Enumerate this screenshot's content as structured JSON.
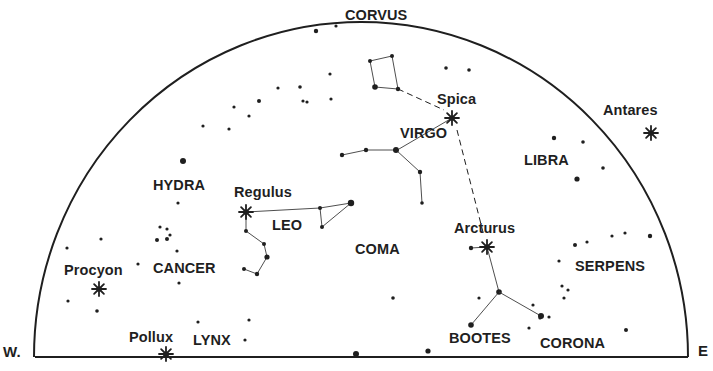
{
  "chart_data": {
    "type": "sky-chart",
    "title": "",
    "directions": {
      "west": "W.",
      "east": "E"
    },
    "ink_color": "#1f1f1f",
    "horizon": {
      "x1": 35,
      "x2": 688,
      "y": 357
    },
    "dome": {
      "cx": 361,
      "cy": 357,
      "rx": 327,
      "ry": 335
    },
    "constellations": [
      {
        "name": "CORVUS",
        "x": 345,
        "y": 8
      },
      {
        "name": "VIRGO",
        "x": 400,
        "y": 126
      },
      {
        "name": "LIBRA",
        "x": 524,
        "y": 153
      },
      {
        "name": "HYDRA",
        "x": 153,
        "y": 178
      },
      {
        "name": "LEO",
        "x": 272,
        "y": 218
      },
      {
        "name": "COMA",
        "x": 355,
        "y": 242
      },
      {
        "name": "CANCER",
        "x": 153,
        "y": 261
      },
      {
        "name": "SERPENS",
        "x": 575,
        "y": 259
      },
      {
        "name": "LYNX",
        "x": 193,
        "y": 333
      },
      {
        "name": "BOOTES",
        "x": 449,
        "y": 331
      },
      {
        "name": "CORONA",
        "x": 540,
        "y": 336
      }
    ],
    "named_stars": [
      {
        "name": "Spica",
        "label_x": 437,
        "label_y": 92,
        "x": 452,
        "y": 118
      },
      {
        "name": "Antares",
        "label_x": 603,
        "label_y": 103,
        "x": 651,
        "y": 133
      },
      {
        "name": "Regulus",
        "label_x": 234,
        "label_y": 185,
        "x": 246,
        "y": 212
      },
      {
        "name": "Arcturus",
        "label_x": 454,
        "label_y": 221,
        "x": 487,
        "y": 247
      },
      {
        "name": "Procyon",
        "label_x": 64,
        "label_y": 263,
        "x": 99,
        "y": 289
      },
      {
        "name": "Pollux",
        "label_x": 129,
        "label_y": 330,
        "x": 166,
        "y": 354
      }
    ],
    "stars": [
      [
        316,
        31,
        2.2
      ],
      [
        336,
        26,
        1.6
      ],
      [
        330,
        74,
        1.6
      ],
      [
        300,
        87,
        1.8
      ],
      [
        303,
        101,
        1.6
      ],
      [
        307,
        102,
        1.6
      ],
      [
        331,
        99,
        1.6
      ],
      [
        278,
        88,
        1.6
      ],
      [
        259,
        101,
        2.0
      ],
      [
        234,
        107,
        1.6
      ],
      [
        249,
        116,
        1.6
      ],
      [
        203,
        126,
        1.6
      ],
      [
        229,
        129,
        1.6
      ],
      [
        183,
        161,
        3.0
      ],
      [
        446,
        68,
        1.8
      ],
      [
        469,
        70,
        1.8
      ],
      [
        554,
        138,
        2.2
      ],
      [
        583,
        142,
        1.8
      ],
      [
        603,
        168,
        1.8
      ],
      [
        577,
        179,
        2.6
      ],
      [
        178,
        203,
        1.6
      ],
      [
        160,
        227,
        1.6
      ],
      [
        167,
        229,
        1.6
      ],
      [
        170,
        235,
        1.6
      ],
      [
        157,
        240,
        2.0
      ],
      [
        167,
        239,
        2.0
      ],
      [
        177,
        251,
        1.6
      ],
      [
        138,
        264,
        1.6
      ],
      [
        179,
        283,
        1.6
      ],
      [
        101,
        239,
        1.6
      ],
      [
        67,
        248,
        1.6
      ],
      [
        68,
        301,
        1.6
      ],
      [
        97,
        311,
        1.8
      ],
      [
        198,
        322,
        1.6
      ],
      [
        249,
        320,
        1.6
      ],
      [
        245,
        340,
        1.6
      ],
      [
        351,
        203,
        2.0
      ],
      [
        393,
        298,
        1.8
      ],
      [
        479,
        298,
        1.6
      ],
      [
        356,
        354,
        3.0
      ],
      [
        428,
        351,
        2.6
      ],
      [
        575,
        245,
        2.0
      ],
      [
        587,
        242,
        1.6
      ],
      [
        612,
        236,
        1.6
      ],
      [
        625,
        233,
        1.6
      ],
      [
        650,
        236,
        2.2
      ],
      [
        559,
        261,
        1.6
      ],
      [
        562,
        286,
        1.6
      ],
      [
        568,
        290,
        1.6
      ],
      [
        564,
        298,
        1.6
      ],
      [
        533,
        305,
        1.6
      ],
      [
        549,
        317,
        1.6
      ],
      [
        540,
        318,
        1.6
      ],
      [
        529,
        328,
        1.6
      ],
      [
        626,
        330,
        2.0
      ]
    ],
    "figure_lines": [
      {
        "name": "corvus",
        "points": [
          [
            370,
            61
          ],
          [
            392,
            56
          ],
          [
            398,
            89
          ],
          [
            375,
            87
          ],
          [
            370,
            61
          ]
        ],
        "star_radii": [
          2.0,
          2.0,
          2.2,
          2.8
        ]
      },
      {
        "name": "virgo",
        "points": [
          [
            342,
            155
          ],
          [
            366,
            150
          ],
          [
            396,
            150
          ],
          [
            420,
            172
          ],
          [
            422,
            203
          ]
        ],
        "star_radii": [
          2.2,
          2.2,
          3.0,
          2.2,
          1.8
        ]
      },
      {
        "name": "virgo-spica",
        "points": [
          [
            399,
            149
          ],
          [
            452,
            118
          ]
        ],
        "star_radii": []
      },
      {
        "name": "leo-top",
        "points": [
          [
            246,
            212
          ],
          [
            320,
            208
          ],
          [
            351,
            203
          ],
          [
            322,
            227
          ],
          [
            320,
            208
          ]
        ],
        "star_radii": [
          0,
          2.0,
          3.2,
          2.0,
          0
        ]
      },
      {
        "name": "leo-sickle",
        "points": [
          [
            246,
            212
          ],
          [
            246,
            231
          ],
          [
            264,
            244
          ],
          [
            267,
            257
          ],
          [
            257,
            274
          ],
          [
            244,
            269
          ]
        ],
        "star_radii": [
          0,
          2.0,
          2.0,
          2.6,
          2.2,
          2.0
        ]
      },
      {
        "name": "bootes",
        "points": [
          [
            471,
            248
          ],
          [
            487,
            247
          ],
          [
            499,
            292
          ],
          [
            471,
            325
          ]
        ],
        "star_radii": [
          2.2,
          0,
          2.8,
          2.8
        ]
      },
      {
        "name": "bootes-arm",
        "points": [
          [
            499,
            292
          ],
          [
            541,
            316
          ]
        ],
        "star_radii": [
          0,
          3.0
        ]
      }
    ],
    "dashed_lines": [
      {
        "name": "corvus-to-spica",
        "points": [
          [
            398,
            89
          ],
          [
            444,
            110
          ]
        ]
      },
      {
        "name": "spica-to-arcturus",
        "points": [
          [
            457,
            130
          ],
          [
            484,
            236
          ]
        ]
      }
    ]
  }
}
